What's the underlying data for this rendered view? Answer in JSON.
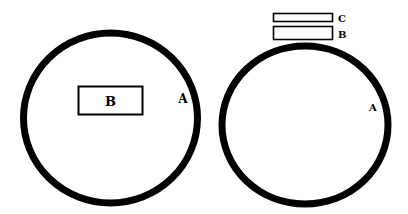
{
  "diagram": {
    "left_figure": {
      "circle_label": "A",
      "inner_box_label": "B"
    },
    "right_figure": {
      "circle_label": "A",
      "stacked_boxes": [
        {
          "label": "C"
        },
        {
          "label": "B"
        }
      ]
    },
    "colors": {
      "stroke": "#000000",
      "background": "#ffffff"
    }
  }
}
